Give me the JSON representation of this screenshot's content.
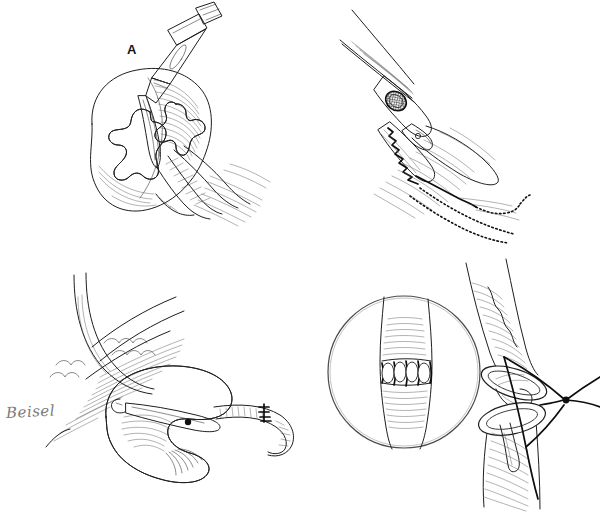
{
  "figure": {
    "background_color": "#ffffff",
    "ink_color": "#1e1e1e",
    "style": "pen-and-ink line drawing with stipple and hatch shading",
    "width": 601,
    "height": 514
  },
  "panels": [
    {
      "id": "A",
      "label": "A",
      "caption_text": "A",
      "position": "top-left",
      "subject": "kidney with opened renal pelvis and calyces, scalpel incising the pelvis",
      "elements": [
        "scalpel-handle",
        "scalpel-blade",
        "kidney-body",
        "renal-calyces",
        "renal-pelvis",
        "renal-hilum-vessels",
        "ureter-stump"
      ]
    },
    {
      "id": "B",
      "label": "B",
      "caption_text": "B",
      "position": "top-right",
      "subject": "surgical clamp or stapling instrument applied across tissue with running suture line",
      "elements": [
        "instrument-shaft",
        "instrument-ring-aperture",
        "instrument-serrated-jaw",
        "tissue-plane-hatching",
        "running-suture-line",
        "dotted-suture-trail"
      ]
    },
    {
      "id": "C",
      "label": "C",
      "caption_text": "C",
      "position": "bottom-left",
      "subject": "retractor and instrument within the operative field over a stippled organ, with sutured vessel anastomosis at right",
      "elements": [
        "retractor-blade",
        "fascial-layer-hatching",
        "stippled-organ-body",
        "clamp-instrument",
        "clamp-pivot-dot",
        "sutured-vessel-segment",
        "interrupted-suture-marks"
      ]
    },
    {
      "id": "D",
      "label": "D",
      "caption_text": "D",
      "position": "bottom-right",
      "subject": "end-to-end vessel anastomosis being sutured, with circular magnified inset showing completed interrupted sutures",
      "elements": [
        "magnifier-circle",
        "inset-vessel",
        "inset-interrupted-sutures",
        "proximal-vessel-cut-end",
        "distal-vessel-cut-end",
        "suture-thread",
        "suture-knot",
        "suture-tails"
      ]
    }
  ],
  "signature": {
    "text": "Beisel",
    "kind": "artist-signature",
    "color": "#7a7a7a"
  },
  "labels": {
    "a": "A",
    "b": "B",
    "c": "C",
    "d": "D"
  }
}
